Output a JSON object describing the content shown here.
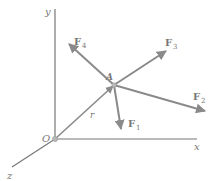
{
  "diagram": {
    "colors": {
      "axis": "#777777",
      "arrow": "#8a8a8a",
      "text": "#777777",
      "origin": "#b8b8b8"
    },
    "axes": {
      "x_label": "x",
      "y_label": "y",
      "z_label": "z",
      "origin_label": "O"
    },
    "point": {
      "label": "A"
    },
    "position_vector": {
      "label": "r"
    },
    "forces": [
      {
        "name": "F",
        "sub": "1"
      },
      {
        "name": "F",
        "sub": "2"
      },
      {
        "name": "F",
        "sub": "3"
      },
      {
        "name": "F",
        "sub": "4"
      }
    ]
  }
}
